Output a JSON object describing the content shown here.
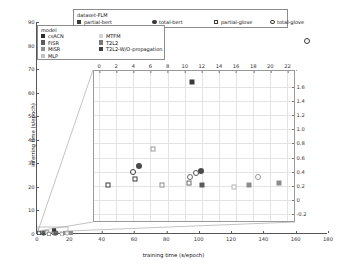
{
  "chart_data": {
    "type": "scatter",
    "title": "",
    "xlabel": "training time (s/epoch)",
    "ylabel": "inferring time (s/epoch)",
    "xlim": [
      0,
      180
    ],
    "ylim": [
      0,
      90
    ],
    "grid": false,
    "outer_xticks": [
      0,
      20,
      40,
      60,
      80,
      100,
      120,
      140,
      160,
      180
    ],
    "outer_yticks": [
      0,
      10,
      20,
      30,
      40,
      50,
      60,
      70,
      80,
      90
    ],
    "inset": {
      "xlabel": "",
      "ylabel": "",
      "xlim": [
        -0.6,
        23.0
      ],
      "ylim": [
        -0.32,
        1.82
      ],
      "xticks": [
        0,
        2,
        4,
        6,
        8,
        10,
        12,
        14,
        16,
        18,
        20,
        22
      ],
      "yticks": [
        "-0.2",
        "0",
        "0.2",
        "0.4",
        "0.6",
        "0.8",
        "1.0",
        "1.2",
        "1.4",
        "1.6"
      ],
      "xaxis_position": "top",
      "yaxis_position": "right",
      "grid": true
    },
    "points": [
      {
        "x": 1.0,
        "y": 0.22,
        "dataset": "partial-glove",
        "model": "csACN",
        "marker": "square-open",
        "color": "#3a3a3a"
      },
      {
        "x": 4.2,
        "y": 0.3,
        "dataset": "partial-glove",
        "model": "FISR",
        "marker": "square-open",
        "color": "#3a3a3a"
      },
      {
        "x": 4.0,
        "y": 0.4,
        "dataset": "total-glove",
        "model": "FISR",
        "marker": "circle-open",
        "color": "#3a3a3a"
      },
      {
        "x": 4.6,
        "y": 0.48,
        "dataset": "total-bert",
        "model": "T2L2",
        "marker": "circle-filled",
        "color": "#4a4a4a"
      },
      {
        "x": 6.3,
        "y": 0.72,
        "dataset": "partial-glove",
        "model": "MTFM",
        "marker": "square-open",
        "color": "#9a9a9a"
      },
      {
        "x": 7.4,
        "y": 0.21,
        "dataset": "partial-glove",
        "model": "MISR",
        "marker": "square-open",
        "color": "#8c8c8c"
      },
      {
        "x": 10.5,
        "y": 0.24,
        "dataset": "partial-glove",
        "model": "MLP",
        "marker": "square-open",
        "color": "#6a6a6a"
      },
      {
        "x": 10.6,
        "y": 0.33,
        "dataset": "total-glove",
        "model": "MLP",
        "marker": "circle-open",
        "color": "#6a6a6a"
      },
      {
        "x": 11.3,
        "y": 0.38,
        "dataset": "total-glove",
        "model": "T2L2-W/O-propagation",
        "marker": "circle-open",
        "color": "#555555"
      },
      {
        "x": 11.9,
        "y": 0.41,
        "dataset": "total-bert",
        "model": "T2L2-W/O-propagation",
        "marker": "circle-filled",
        "color": "#4a4a4a"
      },
      {
        "x": 12.0,
        "y": 0.22,
        "dataset": "partial-bert",
        "model": "T2L2",
        "marker": "square-filled",
        "color": "#5a5a5a"
      },
      {
        "x": 10.8,
        "y": 1.67,
        "dataset": "partial-bert",
        "model": "csACN",
        "marker": "square-filled",
        "color": "#3a3a3a"
      },
      {
        "x": 15.7,
        "y": 0.19,
        "dataset": "partial-glove",
        "model": "T2L2",
        "marker": "square-open",
        "color": "#b4b4b4"
      },
      {
        "x": 17.5,
        "y": 0.22,
        "dataset": "partial-bert",
        "model": "MISR",
        "marker": "square-filled",
        "color": "#8c8c8c"
      },
      {
        "x": 18.6,
        "y": 0.33,
        "dataset": "total-glove",
        "model": "MISR",
        "marker": "circle-open",
        "color": "#9a9a9a"
      },
      {
        "x": 21.0,
        "y": 0.24,
        "dataset": "partial-bert",
        "model": "MTFM",
        "marker": "square-filled",
        "color": "#8c8c8c"
      }
    ],
    "outer_points": [
      {
        "x": 167.0,
        "y": 82.0,
        "dataset": "total-glove",
        "model": "csACN",
        "marker": "circle-open",
        "color": "#3a3a3a"
      }
    ]
  },
  "dataset_legend": {
    "title": "dataset-FLM",
    "entries": [
      {
        "label": "partial-bert",
        "marker": "square-filled",
        "color": "#3a3a3a"
      },
      {
        "label": "total-bert",
        "marker": "circle-filled",
        "color": "#3a3a3a"
      },
      {
        "label": "partial-glove",
        "marker": "square-open",
        "color": "#3a3a3a"
      },
      {
        "label": "total-glove",
        "marker": "circle-open",
        "color": "#3a3a3a"
      }
    ]
  },
  "model_legend": {
    "title": "model",
    "entries": [
      {
        "label": "csACN",
        "marker": "square-filled",
        "color": "#2e2e2e"
      },
      {
        "label": "FISR",
        "marker": "square-filled",
        "color": "#5c5c5c"
      },
      {
        "label": "MISR",
        "marker": "square-filled",
        "color": "#8f8f8f"
      },
      {
        "label": "MLP",
        "marker": "square-filled",
        "color": "#c2c2c2"
      },
      {
        "label": "MTFM",
        "marker": "square-filled",
        "color": "#d4d4d4"
      },
      {
        "label": "T2L2",
        "marker": "square-filled",
        "color": "#7a7a7a"
      },
      {
        "label": "T2L2-W/O-propagation",
        "marker": "square-filled",
        "color": "#3f3f3f"
      }
    ]
  }
}
